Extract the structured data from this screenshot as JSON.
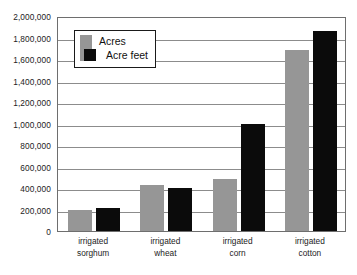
{
  "chart_data": {
    "type": "bar",
    "title": "",
    "subtitle": "",
    "xlabel": "",
    "ylabel": "",
    "categories": [
      "irrigated sorghum",
      "irrigated wheat",
      "irrigated corn",
      "irrigated cotton"
    ],
    "category_lines": [
      [
        "irrigated",
        "sorghum"
      ],
      [
        "irrigated",
        "wheat"
      ],
      [
        "irrigated",
        "corn"
      ],
      [
        "irrigated",
        "cotton"
      ]
    ],
    "series": [
      {
        "name": "Acres",
        "color": "#969696",
        "values": [
          200000,
          430000,
          480000,
          1680000
        ]
      },
      {
        "name": "Acre feet",
        "color": "#0b0b0b",
        "values": [
          215000,
          400000,
          1000000,
          1860000
        ]
      }
    ],
    "ylim": [
      0,
      2000000
    ],
    "yticks": [
      0,
      200000,
      400000,
      600000,
      800000,
      1000000,
      1200000,
      1400000,
      1600000,
      1800000,
      2000000
    ],
    "ytick_labels": [
      "0",
      "200,000",
      "400,000",
      "600,000",
      "800,000",
      "1,000,000",
      "1,200,000",
      "1,400,000",
      "1,600,000",
      "1,800,000",
      "2,000,000"
    ],
    "grid": true,
    "legend_position": "top-left-inside",
    "legend_entries": [
      "Acres",
      "Acre feet"
    ]
  },
  "legend": {
    "acres_label": "Acres",
    "acre_feet_label": "Acre feet"
  },
  "colors": {
    "acres": "#969696",
    "acre_feet": "#0b0b0b",
    "grid": "#8c8c8c",
    "frame": "#6e6e6e",
    "text": "#1c1c1c",
    "background": "#ffffff"
  }
}
